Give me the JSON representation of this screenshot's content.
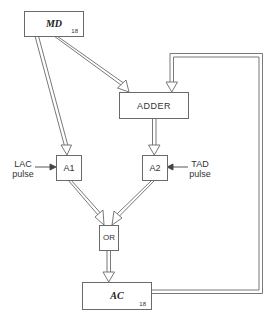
{
  "diagram": {
    "registers": {
      "md": {
        "label": "MD",
        "bits": "18"
      },
      "ac": {
        "label": "AC",
        "bits": "18"
      }
    },
    "blocks": {
      "adder": {
        "label": "ADDER"
      },
      "a1": {
        "label": "A1"
      },
      "a2": {
        "label": "A2"
      },
      "or": {
        "label": "OR"
      }
    },
    "inputs": {
      "lac": {
        "line1": "LAC",
        "line2": "pulse"
      },
      "tad": {
        "line1": "TAD",
        "line2": "pulse"
      }
    },
    "connections": [
      {
        "from": "MD",
        "to": "A1"
      },
      {
        "from": "MD",
        "to": "ADDER"
      },
      {
        "from": "AC",
        "to": "ADDER",
        "note": "feedback loop"
      },
      {
        "from": "ADDER",
        "to": "A2"
      },
      {
        "from": "LAC pulse",
        "to": "A1"
      },
      {
        "from": "TAD pulse",
        "to": "A2"
      },
      {
        "from": "A1",
        "to": "OR"
      },
      {
        "from": "A2",
        "to": "OR"
      },
      {
        "from": "OR",
        "to": "AC"
      }
    ],
    "colors": {
      "line": "#6a6a6a",
      "text": "#333333"
    }
  }
}
